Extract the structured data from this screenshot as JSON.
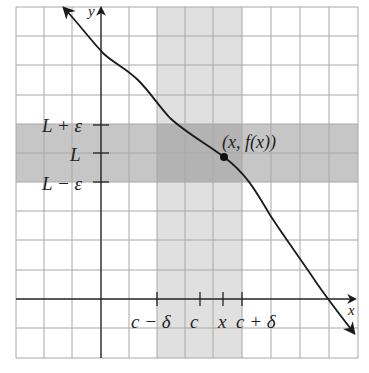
{
  "diagram": {
    "axes": {
      "x_label": "x",
      "y_label": "y"
    },
    "y_ticks": [
      {
        "label": "L + ε",
        "y": 125
      },
      {
        "label": "L",
        "y": 153
      },
      {
        "label": "L − ε",
        "y": 182
      }
    ],
    "x_ticks": [
      {
        "label": "c − δ",
        "x": 157
      },
      {
        "label": "c",
        "x": 200
      },
      {
        "label": "x",
        "x": 223
      },
      {
        "label": "c + δ",
        "x": 242
      }
    ],
    "point_label": "(x, f(x))",
    "colors": {
      "background": "#ffffff",
      "grid": "#a8a8a8",
      "vertical_band": "#dedede",
      "horizontal_band": "#c4c4c4",
      "overlap": "#b0b0b0",
      "axis": "#222222",
      "curve": "#1a1a1a"
    }
  }
}
